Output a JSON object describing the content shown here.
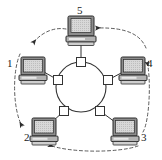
{
  "diagram": {
    "type": "network-topology",
    "background_color": "#ffffff",
    "line_color": "#333333",
    "label_color": "#1a1a1a",
    "ring": {
      "name": "central-ring",
      "shape": "circle",
      "center_x": 81,
      "center_y": 87,
      "radius": 25,
      "port_count": 5,
      "port_shape": "square",
      "port_size": 9
    },
    "token_flow": {
      "style": "dashed",
      "direction": "counter-clockwise",
      "arrow_count": 5
    },
    "nodes": [
      {
        "id": "node-1",
        "label": "1",
        "icon": "desktop-computer-icon",
        "position": "left",
        "cx": 34,
        "cy": 70,
        "label_x": 8,
        "label_y": 60,
        "port_cx": 58,
        "port_cy": 80
      },
      {
        "id": "node-2",
        "label": "2",
        "icon": "desktop-computer-icon",
        "position": "bottom-left",
        "cx": 44,
        "cy": 131,
        "label_x": 24,
        "label_y": 131,
        "port_cx": 64,
        "port_cy": 111
      },
      {
        "id": "node-3",
        "label": "3",
        "icon": "desktop-computer-icon",
        "position": "bottom-right",
        "cx": 125,
        "cy": 131,
        "label_x": 140,
        "label_y": 131,
        "port_cx": 100,
        "port_cy": 111
      },
      {
        "id": "node-4",
        "label": "4",
        "icon": "desktop-computer-icon",
        "position": "right",
        "cx": 134,
        "cy": 70,
        "label_x": 146,
        "label_y": 60,
        "port_cx": 108,
        "port_cy": 80
      },
      {
        "id": "node-5",
        "label": "5",
        "icon": "desktop-computer-icon",
        "position": "top",
        "cx": 81,
        "cy": 30,
        "label_x": 77,
        "label_y": 6,
        "port_cx": 81,
        "port_cy": 62
      }
    ]
  }
}
